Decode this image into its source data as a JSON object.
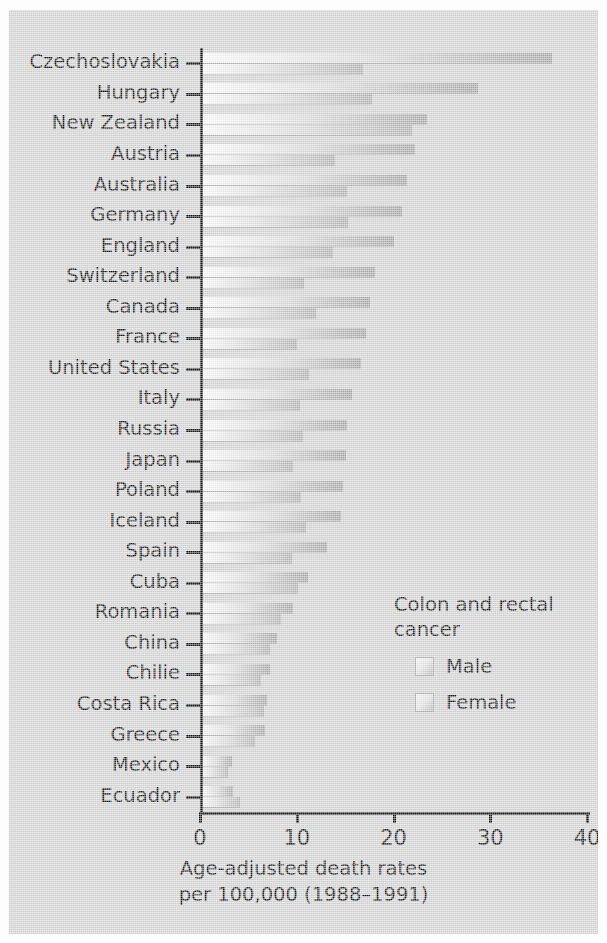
{
  "chart_data": {
    "type": "bar",
    "orientation": "horizontal",
    "title": "",
    "xlabel": "Age-adjusted death rates per 100,000 (1988–1991)",
    "ylabel": "",
    "xlim": [
      0,
      40
    ],
    "xticks": [
      0,
      10,
      20,
      30,
      40
    ],
    "xtick_labels": [
      "0",
      "10",
      "20",
      "30",
      "40"
    ],
    "grid": false,
    "legend_position": "inside-right-lower",
    "legend_title": "Colon and rectal cancer",
    "categories": [
      "Czechoslovakia",
      "Hungary",
      "New Zealand",
      "Austria",
      "Australia",
      "Germany",
      "England",
      "Switzerland",
      "Canada",
      "France",
      "United States",
      "Italy",
      "Russia",
      "Japan",
      "Poland",
      "Iceland",
      "Spain",
      "Cuba",
      "Romania",
      "China",
      "Chilie",
      "Costa Rica",
      "Greece",
      "Mexico",
      "Ecuador"
    ],
    "series": [
      {
        "name": "Male",
        "values": [
          36.4,
          28.7,
          23.5,
          22.2,
          21.4,
          20.9,
          20.1,
          18.1,
          17.6,
          17.2,
          16.6,
          15.7,
          15.2,
          15.1,
          14.8,
          14.6,
          13.1,
          11.2,
          9.6,
          8.0,
          7.2,
          6.9,
          6.7,
          3.3,
          3.4
        ]
      },
      {
        "name": "Female",
        "values": [
          16.8,
          17.8,
          21.9,
          14.0,
          15.2,
          15.3,
          13.7,
          10.8,
          12.0,
          10.0,
          11.3,
          10.3,
          10.6,
          9.6,
          10.4,
          11.0,
          9.5,
          10.1,
          8.4,
          7.2,
          6.3,
          6.6,
          5.7,
          2.9,
          4.1
        ]
      }
    ]
  },
  "axis": {
    "x_title_line1": "Age-adjusted death rates",
    "x_title_line2": "per 100,000 (1988–1991)"
  },
  "legend": {
    "title_line1": "Colon and rectal",
    "title_line2": "cancer",
    "male_label": "Male",
    "female_label": "Female"
  },
  "colors": {
    "background": "#d4d4d4",
    "axis": "#1a1a1a",
    "text": "#171717",
    "bar_light": "#fbfbfb",
    "bar_dark": "#a6a6a6"
  }
}
